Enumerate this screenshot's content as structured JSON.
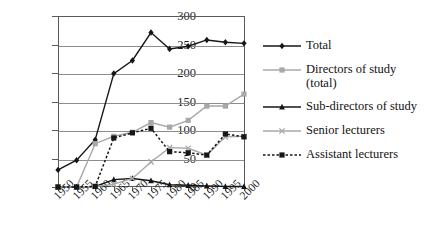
{
  "chart_data": {
    "type": "line",
    "title": "",
    "subtitle": "",
    "xlabel": "",
    "ylabel": "",
    "categories": [
      "1950",
      "1955",
      "1960",
      "1965",
      "1970",
      "1975",
      "1980",
      "1985",
      "1990",
      "1995",
      "2000"
    ],
    "x": [
      1950,
      1955,
      1960,
      1965,
      1970,
      1975,
      1980,
      1985,
      1990,
      1995,
      2000
    ],
    "ylim": [
      0,
      300
    ],
    "yticks": [
      0,
      50,
      100,
      150,
      200,
      250,
      300
    ],
    "grid": true,
    "legend_position": "right",
    "series": [
      {
        "name": "Total",
        "marker": "diamond",
        "color": "#161616",
        "linestyle": "solid",
        "values": [
          30,
          47,
          83,
          199,
          222,
          271,
          242,
          247,
          258,
          254,
          252
        ]
      },
      {
        "name": "Directors of study (total)",
        "marker": "square",
        "color": "#a8a8a8",
        "linestyle": "solid",
        "values": [
          0,
          0,
          76,
          89,
          96,
          113,
          105,
          117,
          142,
          142,
          163
        ]
      },
      {
        "name": "Sub-directors of study",
        "marker": "triangle",
        "color": "#161616",
        "linestyle": "solid",
        "values": [
          0,
          0,
          1,
          13,
          15,
          11,
          4,
          3,
          2,
          1,
          1
        ]
      },
      {
        "name": "Senior lecturers",
        "marker": "x",
        "color": "#a8a8a8",
        "linestyle": "solid",
        "values": [
          0,
          0,
          1,
          5,
          15,
          44,
          69,
          68,
          56,
          88,
          89
        ]
      },
      {
        "name": "Assistant lecturers",
        "marker": "square",
        "color": "#161616",
        "linestyle": "dashed",
        "values": [
          0,
          0,
          1,
          86,
          95,
          103,
          62,
          60,
          56,
          93,
          88
        ]
      }
    ]
  },
  "legend": {
    "items": [
      {
        "label": "Total"
      },
      {
        "label": "Directors of study\n(total)"
      },
      {
        "label": "Sub-directors of study"
      },
      {
        "label": "Senior lecturers"
      },
      {
        "label": "Assistant lecturers"
      }
    ]
  },
  "axes": {
    "y_tick_labels": [
      "300",
      "250",
      "200",
      "150",
      "100",
      "50",
      "0"
    ],
    "x_tick_labels": [
      "1950",
      "1955",
      "1960",
      "1965",
      "1970",
      "1975",
      "1980",
      "1985",
      "1990",
      "1995",
      "2000"
    ]
  },
  "colors": {
    "dark": "#161616",
    "gray": "#a8a8a8",
    "grid": "#8d8d8d",
    "frame": "#5a5a5a",
    "background": "#ffffff"
  }
}
